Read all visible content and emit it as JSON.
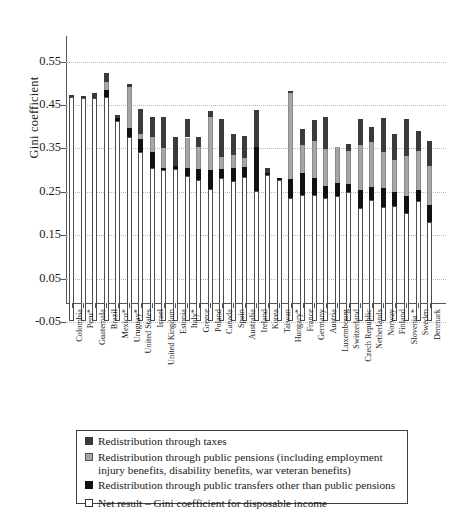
{
  "chart_data": {
    "type": "bar",
    "subtype": "stacked",
    "title": "",
    "xlabel": "",
    "ylabel": "Gini coefficient",
    "ylim": [
      -0.05,
      0.6
    ],
    "yticks": [
      0.55,
      0.45,
      0.35,
      0.25,
      0.15,
      0.05,
      -0.05
    ],
    "ytick_labels": [
      "0.55",
      "0.45",
      "0.35",
      "0.25",
      "0.15",
      "0.05",
      "-0.05"
    ],
    "grid": "horizontal-dotted",
    "legend_position": "below-plot",
    "series": [
      {
        "name": "Net result – Gini coefficient for disposable income",
        "key": "net",
        "color": "#ffffff"
      },
      {
        "name": "Redistribution through public transfers other than public pensions",
        "key": "transfers",
        "color": "#111111"
      },
      {
        "name": "Redistribution through public pensions (including employment injury benefits, disability benefits, war veteran benefits)",
        "key": "pensions",
        "color": "#a6a6a6"
      },
      {
        "name": "Redistribution through taxes",
        "key": "taxes",
        "color": "#3a3a3a"
      }
    ],
    "categories": [
      "Colombia",
      "Peru*",
      "Guatemala",
      "Brazil",
      "Mexico*",
      "Uruguay*",
      "United States",
      "Israel",
      "United Kingdom",
      "Estonia",
      "Italy*",
      "Greece",
      "Poland",
      "Canada",
      "Spain",
      "Australia",
      "Ireland",
      "Korea",
      "Taiwan",
      "Hungary*",
      "France",
      "Germany",
      "Austria",
      "Luxembourg",
      "Switzerland",
      "Czech Republic",
      "Netherlands",
      "Norway",
      "Finland",
      "Slovenia *",
      "Sweden",
      "Denmark"
    ],
    "values": {
      "net": [
        0.516,
        0.514,
        0.513,
        0.517,
        0.462,
        0.425,
        0.39,
        0.352,
        0.348,
        0.35,
        0.334,
        0.325,
        0.305,
        0.33,
        0.323,
        0.332,
        0.3,
        0.336,
        0.324,
        0.283,
        0.291,
        0.29,
        0.283,
        0.288,
        0.297,
        0.261,
        0.279,
        0.262,
        0.265,
        0.25,
        0.277,
        0.228
      ],
      "transfers": [
        0.0,
        0.0,
        0.0,
        0.016,
        0.007,
        0.021,
        0.03,
        0.038,
        0.004,
        0.007,
        0.018,
        0.026,
        0.044,
        0.02,
        0.03,
        0.022,
        0.1,
        0.005,
        0.005,
        0.045,
        0.05,
        0.04,
        0.029,
        0.03,
        0.018,
        0.04,
        0.03,
        0.044,
        0.033,
        0.038,
        0.024,
        0.04
      ],
      "pensions": [
        0.0,
        0.0,
        0.0,
        0.019,
        0.0,
        0.093,
        0.01,
        0.034,
        0.046,
        0.0,
        0.071,
        0.051,
        0.121,
        0.027,
        0.029,
        0.021,
        0.0,
        0.0,
        0.0,
        0.198,
        0.064,
        0.085,
        0.085,
        0.084,
        0.078,
        0.105,
        0.104,
        0.083,
        0.072,
        0.092,
        0.091,
        0.09
      ],
      "taxes": [
        0.005,
        0.004,
        0.012,
        0.02,
        0.005,
        0.008,
        0.058,
        0.046,
        0.073,
        0.068,
        0.042,
        0.023,
        0.015,
        0.088,
        0.048,
        0.051,
        0.087,
        0.011,
        0.0,
        0.005,
        0.038,
        0.049,
        0.073,
        0.0,
        0.014,
        0.06,
        0.035,
        0.08,
        0.06,
        0.085,
        0.047,
        0.057
      ]
    }
  },
  "legend": {
    "rows": [
      {
        "marker": "tax-marker",
        "text": "Redistribution through taxes"
      },
      {
        "marker": "pension-marker",
        "text": "Redistribution through public pensions (including employment injury benefits, disability benefits, war veteran benefits)"
      },
      {
        "marker": "transfer-marker",
        "text": "Redistribution through public transfers other than public pensions"
      },
      {
        "marker": "net-marker",
        "text": "Net result – Gini coefficient for disposable income"
      }
    ]
  }
}
